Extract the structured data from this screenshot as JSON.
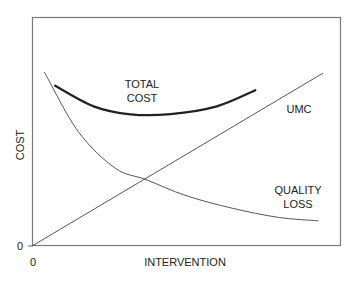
{
  "chart_data": {
    "type": "line",
    "title": "",
    "xlabel": "INTERVENTION",
    "ylabel": "COST",
    "x_ticks": [
      "0"
    ],
    "y_ticks": [
      "0"
    ],
    "grid": false,
    "legend": "none (curves labeled inline)",
    "xlim": [
      0,
      100
    ],
    "ylim": [
      0,
      100
    ],
    "series": [
      {
        "name": "TOTAL COST",
        "label_lines": [
          "TOTAL",
          "COST"
        ],
        "style": "thick",
        "points": [
          [
            7.5,
            70
          ],
          [
            20,
            61
          ],
          [
            32,
            57.5
          ],
          [
            45,
            57.6
          ],
          [
            60,
            61
          ],
          [
            72.5,
            68
          ]
        ]
      },
      {
        "name": "UMC",
        "label_lines": [
          "UMC"
        ],
        "style": "thin",
        "points": [
          [
            0,
            0
          ],
          [
            94.5,
            75.5
          ]
        ]
      },
      {
        "name": "QUALITY LOSS",
        "label_lines": [
          "QUALITY",
          "LOSS"
        ],
        "style": "thin",
        "points": [
          [
            4,
            76
          ],
          [
            15,
            50
          ],
          [
            27,
            34
          ],
          [
            37,
            29
          ],
          [
            50,
            22
          ],
          [
            65,
            16.5
          ],
          [
            80,
            12.5
          ],
          [
            93,
            11
          ]
        ]
      }
    ],
    "annotations": [
      "Curves intersect (UMC = QUALITY LOSS) near x≈37"
    ]
  },
  "labels": {
    "total": [
      "TOTAL",
      "COST"
    ],
    "umc": "UMC",
    "quality": [
      "QUALITY",
      "LOSS"
    ],
    "xlabel": "INTERVENTION",
    "ylabel": "COST",
    "x0": "0",
    "y0": "0"
  }
}
